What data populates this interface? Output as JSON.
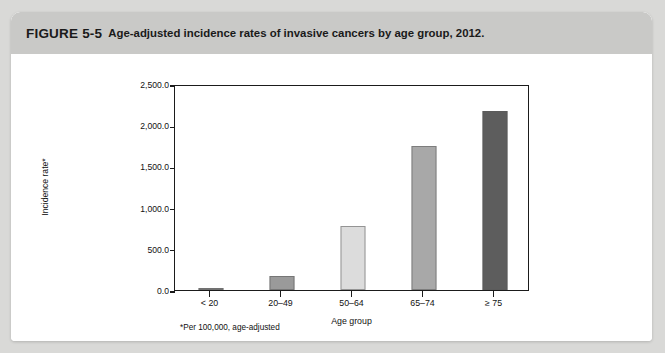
{
  "figure": {
    "number": "FIGURE 5-5",
    "caption": "Age-adjusted incidence rates of invasive cancers by age group, 2012.",
    "footnote": "*Per 100,000, age-adjusted"
  },
  "colors": {
    "page_background": "#d9d9d7",
    "card_background": "#ffffff",
    "banner_background": "#c9c9c7",
    "axis": "#1b1b1b",
    "text": "#111111"
  },
  "chart_data": {
    "type": "bar",
    "title": "Age-adjusted incidence rates of invasive cancers by age group, 2012.",
    "xlabel": "Age group",
    "ylabel": "Incidence rate*",
    "categories": [
      "< 20",
      "20–49",
      "50–64",
      "65–74",
      "≥ 75"
    ],
    "values": [
      12.0,
      170.0,
      780.0,
      1745.0,
      2170.0
    ],
    "bar_colors": [
      "#8f8f8f",
      "#9a9a9a",
      "#dcdcdc",
      "#a8a8a8",
      "#5d5d5d"
    ],
    "ylim": [
      0,
      2500
    ],
    "ytick_values": [
      0,
      500,
      1000,
      1500,
      2000,
      2500
    ],
    "ytick_labels": [
      "0.0",
      "500.0",
      "1,000.0",
      "1,500.0",
      "2,000.0",
      "2,500.0"
    ],
    "grid": false,
    "legend": null
  }
}
